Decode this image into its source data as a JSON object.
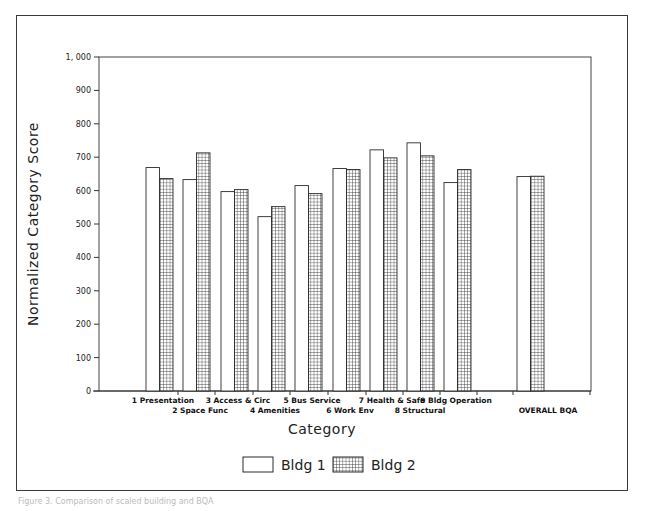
{
  "chart_data": {
    "type": "bar",
    "title": "",
    "xlabel": "Category",
    "ylabel": "Normalized Category Score",
    "ylim": [
      0,
      1000
    ],
    "yticks": [
      0,
      100,
      200,
      300,
      400,
      500,
      600,
      700,
      800,
      900,
      1000
    ],
    "ytick_labels": [
      "0",
      "100",
      "200",
      "300",
      "400",
      "500",
      "600",
      "700",
      "800",
      "900",
      "1, 000"
    ],
    "grid": false,
    "legend_position": "bottom-center",
    "categories": [
      "1 Presentation",
      "2 Space Func",
      "3 Access & Circ",
      "4 Amenities",
      "5 Bus Service",
      "6 Work Env",
      "7 Health & Safe",
      "8 Structural",
      "9 Bldg Operation",
      "OVERALL BQA"
    ],
    "series": [
      {
        "name": "Bldg 1",
        "pattern": "none",
        "values": [
          669,
          633,
          597,
          522,
          615,
          666,
          722,
          743,
          624,
          642
        ]
      },
      {
        "name": "Bldg 2",
        "pattern": "crosshatch",
        "values": [
          636,
          713,
          603,
          552,
          591,
          663,
          698,
          704,
          663,
          643
        ]
      }
    ]
  },
  "legend": {
    "items": [
      {
        "label": "Bldg 1",
        "swatch": "open"
      },
      {
        "label": "Bldg 2",
        "swatch": "grid"
      }
    ]
  },
  "caption": "Figure 3. Comparison of scaled building and BQA",
  "colors": {
    "frame": "#3a3a3a",
    "bar_outline": "#2a2a2a",
    "hatch": "#333333",
    "background": "#ffffff"
  }
}
